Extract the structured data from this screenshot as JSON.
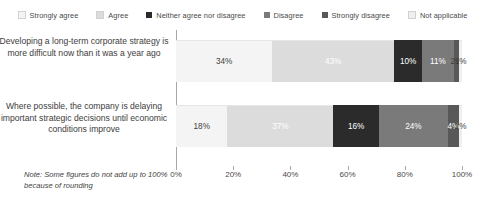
{
  "chart_data": {
    "type": "bar",
    "orientation": "horizontal",
    "stacked": true,
    "normalized_percent": true,
    "title": "",
    "subtitle": "",
    "xlabel": "",
    "ylabel": "",
    "xlim": [
      0,
      100
    ],
    "xticks": [
      "0%",
      "20%",
      "40%",
      "60%",
      "80%",
      "100%"
    ],
    "xtick_values": [
      0,
      20,
      40,
      60,
      80,
      100
    ],
    "grid": false,
    "legend_position": "top",
    "categories": [
      "Developing a long-term corporate strategy is more difficult now than it was a year ago",
      "Where possible, the company is delaying important strategic decisions until economic conditions improve"
    ],
    "series": [
      {
        "name": "Strongly agree",
        "color": "#f4f4f4",
        "text_color": "#3f3f3f",
        "values": [
          34,
          18
        ],
        "labels": [
          "34%",
          "18%"
        ]
      },
      {
        "name": "Agree",
        "color": "#dcdcdc",
        "text_color": "#ffffff",
        "values": [
          43,
          37
        ],
        "labels": [
          "43%",
          "37%"
        ]
      },
      {
        "name": "Neither agree nor disagree",
        "color": "#2b2b2b",
        "text_color": "#ffffff",
        "values": [
          10,
          16
        ],
        "labels": [
          "10%",
          "16%"
        ]
      },
      {
        "name": "Disagree",
        "color": "#7a7a7a",
        "text_color": "#ffffff",
        "values": [
          11,
          24
        ],
        "labels": [
          "11%",
          "24%"
        ]
      },
      {
        "name": "Strongly disagree",
        "color": "#585858",
        "text_color": "#ffffff",
        "values": [
          2,
          4
        ],
        "labels": [
          "2%",
          "4%"
        ]
      },
      {
        "name": "Not applicable",
        "color": "#efefef",
        "text_color": "#3f3f3f",
        "values": [
          1,
          1
        ],
        "labels": [
          "1%",
          "1%"
        ]
      }
    ],
    "note": "Note: Some figures do not add up to 100% because of rounding"
  },
  "legend": {
    "items": [
      {
        "label": "Strongly agree",
        "color": "#f4f4f4"
      },
      {
        "label": "Agree",
        "color": "#dcdcdc"
      },
      {
        "label": "Neither agree nor disagree",
        "color": "#2b2b2b"
      },
      {
        "label": "Disagree",
        "color": "#7a7a7a"
      },
      {
        "label": "Strongly disagree",
        "color": "#585858"
      },
      {
        "label": "Not applicable",
        "color": "#efefef"
      }
    ]
  }
}
